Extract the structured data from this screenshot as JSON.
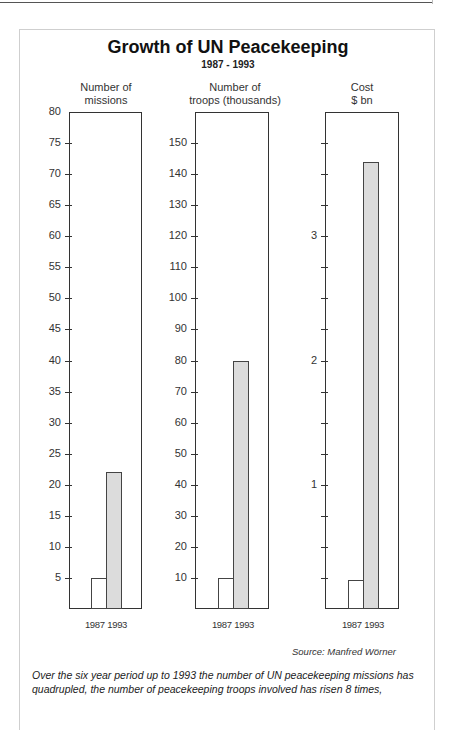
{
  "header": {
    "title": "Growth of UN Peacekeeping",
    "subtitle": "1987 - 1993"
  },
  "panels": [
    {
      "label_line1": "Number of",
      "label_line2": "missions",
      "x_label": "1987 1993",
      "tick_labels": [
        "80",
        "75",
        "70",
        "65",
        "60",
        "55",
        "50",
        "45",
        "40",
        "35",
        "30",
        "25",
        "20",
        "15",
        "10",
        "5"
      ]
    },
    {
      "label_line1": "Number of",
      "label_line2": "troops (thousands)",
      "x_label": "1987 1993",
      "tick_labels": [
        "150",
        "140",
        "130",
        "120",
        "110",
        "100",
        "90",
        "80",
        "70",
        "60",
        "50",
        "40",
        "30",
        "20",
        "10"
      ]
    },
    {
      "label_line1": "Cost",
      "label_line2": "$ bn",
      "x_label": "1987 1993",
      "tick_labels": [
        "3",
        "2",
        "1"
      ]
    }
  ],
  "source": "Source: Manfred Wörner",
  "caption": "Over the six year period up to 1993 the number of UN peacekeeping missions has quadrupled, the number of peacekeeping troops involved has risen 8 times,",
  "colors": {
    "bar_1987": "#ffffff",
    "bar_1993": "#dcdcdc",
    "frame": "#333333"
  },
  "chart_data": [
    {
      "type": "bar",
      "title": "Number of missions",
      "categories": [
        "1987",
        "1993"
      ],
      "values": [
        5,
        22
      ],
      "xlabel": "",
      "ylabel": "Number of missions",
      "ylim": [
        0,
        80
      ],
      "yticks": [
        5,
        10,
        15,
        20,
        25,
        30,
        35,
        40,
        45,
        50,
        55,
        60,
        65,
        70,
        75,
        80
      ]
    },
    {
      "type": "bar",
      "title": "Number of troops (thousands)",
      "categories": [
        "1987",
        "1993"
      ],
      "values": [
        10,
        80
      ],
      "xlabel": "",
      "ylabel": "Number of troops (thousands)",
      "ylim": [
        0,
        160
      ],
      "yticks": [
        10,
        20,
        30,
        40,
        50,
        60,
        70,
        80,
        90,
        100,
        110,
        120,
        130,
        140,
        150
      ]
    },
    {
      "type": "bar",
      "title": "Cost $ bn",
      "categories": [
        "1987",
        "1993"
      ],
      "values": [
        0.23,
        3.6
      ],
      "xlabel": "",
      "ylabel": "Cost $ bn",
      "ylim": [
        0,
        4
      ],
      "yticks": [
        1,
        2,
        3
      ],
      "minor_tick_step": 0.25
    }
  ]
}
